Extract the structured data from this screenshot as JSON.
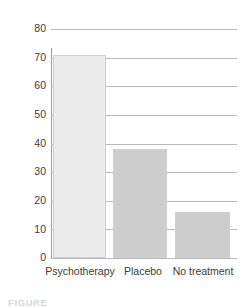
{
  "chart_data": {
    "type": "bar",
    "title": "",
    "subtitle": "",
    "xlabel": "",
    "ylabel": "Percent improved",
    "categories": [
      "Psychotherapy",
      "Placebo",
      "No treatment"
    ],
    "values": [
      71,
      38,
      16
    ],
    "series": [
      {
        "name": "Percent improved",
        "values": [
          71,
          38,
          16
        ]
      }
    ],
    "ylim": [
      0,
      80
    ],
    "yticks": [
      80,
      70,
      60,
      50,
      40,
      30,
      20,
      10,
      0
    ],
    "ytick_labels": [
      "80",
      "70",
      "60",
      "50",
      "40",
      "30",
      "20",
      "10",
      "0"
    ],
    "grid": true,
    "grid_axis": "y",
    "legend": false,
    "legend_position": "none",
    "annotations": [],
    "bar_colors": [
      "#ececec",
      "#cdcdcd",
      "#cdcdcd"
    ],
    "bar_border_color": "#cfcfcf",
    "gridline_color": "#b9b9b9",
    "axis_color": "#9a9a9a",
    "text_color": "#3b3b3b",
    "background_color": "#ffffff"
  },
  "caption": {
    "text": "FIGURE"
  }
}
